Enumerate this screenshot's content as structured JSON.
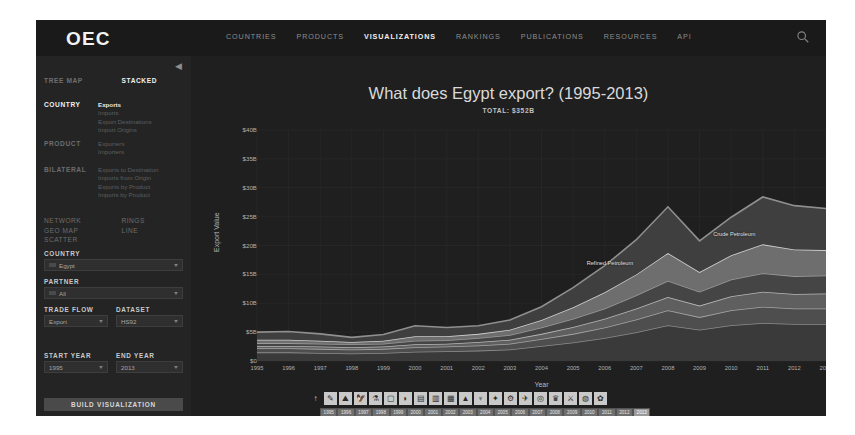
{
  "brand": {
    "logo": "OEC"
  },
  "nav": {
    "items": [
      {
        "label": "COUNTRIES",
        "active": false
      },
      {
        "label": "PRODUCTS",
        "active": false
      },
      {
        "label": "VISUALIZATIONS",
        "active": true
      },
      {
        "label": "RANKINGS",
        "active": false
      },
      {
        "label": "PUBLICATIONS",
        "active": false
      },
      {
        "label": "RESOURCES",
        "active": false
      },
      {
        "label": "API",
        "active": false
      }
    ],
    "search_icon": "search-icon"
  },
  "sidebar": {
    "collapse_icon": "collapse-icon",
    "viz_types": [
      {
        "label": "TREE MAP",
        "active": false
      },
      {
        "label": "STACKED",
        "active": true
      }
    ],
    "groups": [
      {
        "label": "COUNTRY",
        "active": true,
        "items": [
          {
            "label": "Exports",
            "selected": true
          },
          {
            "label": "Imports",
            "selected": false
          },
          {
            "label": "Export Destinations",
            "selected": false
          },
          {
            "label": "Import Origins",
            "selected": false
          }
        ]
      },
      {
        "label": "PRODUCT",
        "active": false,
        "items": [
          {
            "label": "Exporters",
            "selected": false
          },
          {
            "label": "Importers",
            "selected": false
          }
        ]
      },
      {
        "label": "BILATERAL",
        "active": false,
        "items": [
          {
            "label": "Exports to Destination",
            "selected": false
          },
          {
            "label": "Imports from Origin",
            "selected": false
          },
          {
            "label": "Exports by Product",
            "selected": false
          },
          {
            "label": "Imports by Product",
            "selected": false
          }
        ]
      }
    ],
    "modes_left": [
      {
        "label": "NETWORK",
        "active": false
      },
      {
        "label": "GEO MAP",
        "active": false
      },
      {
        "label": "SCATTER",
        "active": false
      }
    ],
    "modes_right": [
      {
        "label": "RINGS",
        "active": false
      },
      {
        "label": "LINE",
        "active": false
      }
    ],
    "fields": [
      {
        "name": "country",
        "label": "COUNTRY",
        "value": "Egypt",
        "flag": true
      },
      {
        "name": "partner",
        "label": "PARTNER",
        "value": "All",
        "flag": true
      },
      {
        "name": "trade-flow",
        "label": "TRADE FLOW",
        "value": "Export",
        "flag": false
      },
      {
        "name": "dataset",
        "label": "DATASET",
        "value": "HS92",
        "flag": false
      },
      {
        "name": "start-year",
        "label": "START YEAR",
        "value": "1995",
        "flag": false
      },
      {
        "name": "end-year",
        "label": "END YEAR",
        "value": "2013",
        "flag": false
      }
    ],
    "build_button": "BUILD VISUALIZATION"
  },
  "main": {
    "title": "What does Egypt export? (1995-2013)",
    "subtitle": "TOTAL: $352B"
  },
  "chart_data": {
    "type": "area",
    "title": "What does Egypt export? (1995-2013)",
    "subtitle": "TOTAL: $352B",
    "xlabel": "Year",
    "ylabel": "Export Value",
    "grid": true,
    "legend_position": "in-plot-labels",
    "ylim": [
      0,
      40
    ],
    "ytick_labels": [
      "$40B",
      "$35B",
      "$30B",
      "$25B",
      "$20B",
      "$15B",
      "$10B",
      "$5B",
      "$0"
    ],
    "ytick_values": [
      40,
      35,
      30,
      25,
      20,
      15,
      10,
      5,
      0
    ],
    "x": [
      1995,
      1996,
      1997,
      1998,
      1999,
      2000,
      2001,
      2002,
      2003,
      2004,
      2005,
      2006,
      2007,
      2008,
      2009,
      2010,
      2011,
      2012,
      2013
    ],
    "xtick_labels": [
      "1995",
      "1996",
      "1997",
      "1998",
      "1999",
      "2000",
      "2001",
      "2002",
      "2003",
      "2004",
      "2005",
      "2006",
      "2007",
      "2008",
      "2009",
      "2010",
      "2011",
      "2012",
      "2013"
    ],
    "annotations": [
      {
        "text": "Refined Petroleum",
        "x": 2006,
        "y": 17
      },
      {
        "text": "Crude Petroleum",
        "x": 2010,
        "y": 22
      }
    ],
    "series": [
      {
        "name": "Other",
        "values": [
          1.5,
          1.5,
          1.4,
          1.3,
          1.4,
          1.6,
          1.7,
          1.8,
          2.0,
          2.6,
          3.2,
          4.0,
          5.0,
          6.2,
          5.4,
          6.2,
          6.6,
          6.4,
          6.4
        ]
      },
      {
        "name": "Textiles",
        "values": [
          0.7,
          0.7,
          0.7,
          0.7,
          0.7,
          0.8,
          0.8,
          0.9,
          1.0,
          1.2,
          1.5,
          1.8,
          2.2,
          2.6,
          2.2,
          2.6,
          2.8,
          2.7,
          2.7
        ]
      },
      {
        "name": "Machines",
        "values": [
          0.4,
          0.4,
          0.4,
          0.4,
          0.4,
          0.5,
          0.5,
          0.6,
          0.7,
          0.9,
          1.2,
          1.5,
          1.9,
          2.3,
          2.0,
          2.4,
          2.6,
          2.5,
          2.6
        ]
      },
      {
        "name": "Chemicals",
        "values": [
          0.5,
          0.5,
          0.5,
          0.5,
          0.5,
          0.6,
          0.6,
          0.7,
          0.8,
          1.1,
          1.4,
          1.8,
          2.3,
          2.8,
          2.4,
          2.9,
          3.2,
          3.1,
          3.1
        ]
      },
      {
        "name": "Refined Petroleum",
        "values": [
          0.6,
          0.6,
          0.5,
          0.4,
          0.5,
          0.8,
          0.7,
          0.7,
          0.9,
          1.3,
          2.0,
          2.8,
          3.6,
          4.8,
          3.4,
          4.2,
          5.0,
          4.6,
          4.4
        ]
      },
      {
        "name": "Crude Petroleum",
        "values": [
          1.3,
          1.4,
          1.2,
          0.8,
          1.1,
          1.8,
          1.5,
          1.4,
          1.7,
          2.3,
          3.4,
          4.6,
          6.0,
          8.0,
          5.4,
          6.6,
          8.2,
          7.6,
          7.2
        ]
      }
    ],
    "totals": [
      5.0,
      5.1,
      4.7,
      4.1,
      4.6,
      6.1,
      5.8,
      6.1,
      7.1,
      9.4,
      12.7,
      16.5,
      21.0,
      26.7,
      20.8,
      24.9,
      28.4,
      26.9,
      26.4
    ]
  },
  "toolbar": {
    "icons": [
      "cursor-icon",
      "pencil-icon",
      "mushroom-icon",
      "bird-icon",
      "flask-icon",
      "plastics-icon",
      "leather-icon",
      "wood-icon",
      "paper-icon",
      "textiles-icon",
      "footwear-icon",
      "stone-icon",
      "metals-icon",
      "machines-icon",
      "transport-icon",
      "instruments-icon",
      "arts-icon",
      "weapons-icon",
      "unspecified-icon",
      "services-icon"
    ]
  },
  "year_selector": {
    "years": [
      "1995",
      "1996",
      "1997",
      "1998",
      "1999",
      "2000",
      "2001",
      "2002",
      "2003",
      "2004",
      "2005",
      "2006",
      "2007",
      "2008",
      "2009",
      "2010",
      "2011",
      "2012",
      "2013"
    ],
    "selected": "2013"
  }
}
